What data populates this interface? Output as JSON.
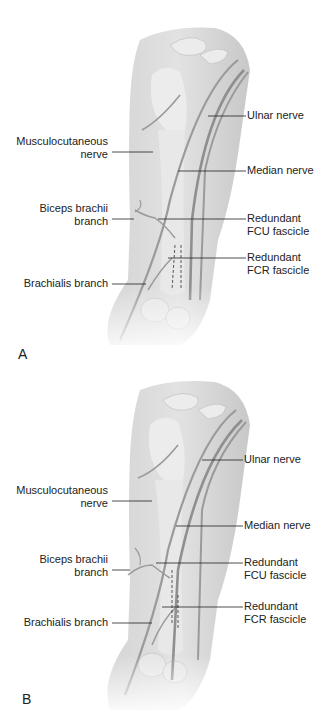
{
  "figure": {
    "panels": [
      {
        "letter": "A",
        "labels": {
          "musculocutaneous_1": "Musculocutaneous",
          "musculocutaneous_2": "nerve",
          "biceps_1": "Biceps brachii",
          "biceps_2": "branch",
          "brachialis": "Brachialis branch",
          "ulnar": "Ulnar nerve",
          "median": "Median nerve",
          "fcu_1": "Redundant",
          "fcu_2": "FCU fascicle",
          "fcr_1": "Redundant",
          "fcr_2": "FCR fascicle"
        }
      },
      {
        "letter": "B",
        "labels": {
          "musculocutaneous_1": "Musculocutaneous",
          "musculocutaneous_2": "nerve",
          "biceps_1": "Biceps brachii",
          "biceps_2": "branch",
          "brachialis": "Brachialis branch",
          "ulnar": "Ulnar nerve",
          "median": "Median nerve",
          "fcu_1": "Redundant",
          "fcu_2": "FCU fascicle",
          "fcr_1": "Redundant",
          "fcr_2": "FCR fascicle"
        }
      }
    ],
    "colors": {
      "skin": "#dcdcdc",
      "bone": "#ececec",
      "nerve": "#9a9a9a",
      "leader": "#222222"
    }
  }
}
